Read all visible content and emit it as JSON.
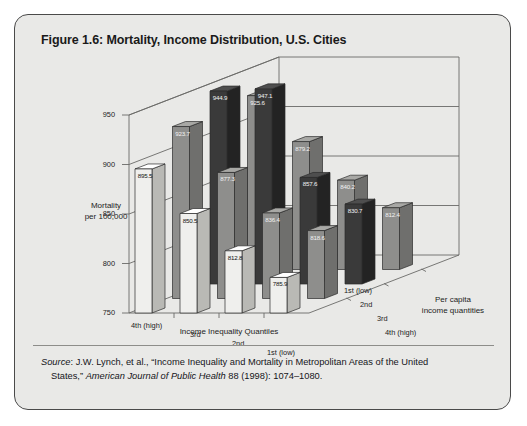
{
  "figure": {
    "title": "Figure 1.6: Mortality, Income Distribution, U.S. Cities",
    "source_prefix": "Source",
    "source_line1": ": J.W. Lynch, et al., “Income Inequality and Mortality in Metropolitan Areas of the United",
    "source_line2_a": "States,” ",
    "source_line2_journal": "American Journal of Public Health",
    "source_line2_b": " 88 (1998): 1074–1080."
  },
  "chart_data": {
    "type": "bar",
    "title": "Figure 1.6: Mortality, Income Distribution, U.S. Cities",
    "xlabel": "Income Inequality Quantiles",
    "ylabel": "Mortality per 100,000",
    "zlabel": "Per capita income quantities",
    "ylim": [
      750,
      950
    ],
    "yticks": [
      750,
      800,
      850,
      900,
      950
    ],
    "grid": true,
    "legend": "none",
    "categories": [
      "4th (high)",
      "3rd",
      "2nd",
      "1st (low)"
    ],
    "depth_categories": [
      "1st (low)",
      "2nd",
      "3rd",
      "4th (high)"
    ],
    "series": [
      {
        "name": "1st (low)",
        "values": [
          895.5,
          850.5,
          812.8,
          785.9
        ]
      },
      {
        "name": "2nd",
        "values": [
          923.7,
          877.3,
          836.4,
          818.6
        ]
      },
      {
        "name": "3rd",
        "values": [
          944.9,
          947.1,
          857.6,
          830.7
        ]
      },
      {
        "name": "4th (high)",
        "values": [
          925.6,
          879.2,
          840.2,
          812.4
        ]
      }
    ],
    "colors": {
      "bar_light": "#efefed",
      "bar_light_side": "#b9b9b5",
      "bar_mid": "#8e8e8c",
      "bar_mid_side": "#6f6f6d",
      "bar_dark": "#3a3a3a",
      "bar_dark_side": "#232323",
      "panel": "#e9e9e7",
      "axis": "#6a6a68"
    }
  },
  "axis": {
    "y_ticks": [
      "950",
      "900",
      "850",
      "800",
      "750"
    ],
    "y_title_l1": "Mortality",
    "y_title_l2": "per 100,000",
    "x_ticks": [
      "4th (high)",
      "3rd",
      "2nd",
      "1st (low)"
    ],
    "x_title": "Income Inequality Quantiles",
    "z_ticks": [
      "1st (low)",
      "2nd",
      "3rd",
      "4th (high)"
    ],
    "z_title_l1": "Per capita",
    "z_title_l2": "income quantities"
  },
  "bar_labels": [
    "895.5",
    "850.5",
    "812.8",
    "785.9",
    "923.7",
    "877.3",
    "836.4",
    "818.6",
    "944.9",
    "947.1",
    "857.6",
    "830.7",
    "925.6",
    "879.2",
    "840.2",
    "812.4"
  ]
}
